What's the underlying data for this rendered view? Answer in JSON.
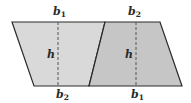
{
  "diagram": {
    "type": "geometry",
    "colors": {
      "left_fill": "#d9d9d9",
      "right_fill": "#c6c6c6",
      "stroke": "#2a2a2a",
      "dash": "#555555"
    },
    "left_trapezoid": {
      "vertices": [
        [
          12,
          22
        ],
        [
          105,
          22
        ],
        [
          89,
          86
        ],
        [
          34,
          86
        ]
      ],
      "height_line": {
        "x": 58,
        "y1": 22,
        "y2": 86
      },
      "labels": {
        "top": {
          "base": "b",
          "sub": "1",
          "x": 53,
          "y": 15
        },
        "height": {
          "text": "h",
          "x": 47,
          "y": 58
        },
        "bottom": {
          "base": "b",
          "sub": "2",
          "x": 56,
          "y": 98
        }
      }
    },
    "right_trapezoid": {
      "vertices": [
        [
          105,
          22
        ],
        [
          160,
          22
        ],
        [
          182,
          86
        ],
        [
          89,
          86
        ]
      ],
      "height_line": {
        "x": 136,
        "y1": 22,
        "y2": 86
      },
      "labels": {
        "top": {
          "base": "b",
          "sub": "2",
          "x": 128,
          "y": 15
        },
        "height": {
          "text": "h",
          "x": 125,
          "y": 58
        },
        "bottom": {
          "base": "b",
          "sub": "1",
          "x": 131,
          "y": 98
        }
      }
    }
  }
}
